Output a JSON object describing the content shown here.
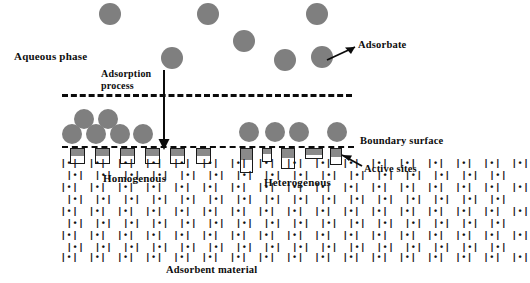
{
  "figure": {
    "background_color": "#ffffff",
    "particle_color": "#7f7f7f",
    "line_color": "#0b0b0b",
    "pore_fill_color": "#8a8a8a"
  },
  "labels": {
    "aqueous_phase": "Aqueous phase",
    "adsorption_process_line1": "Adsorption",
    "adsorption_process_line2": "process",
    "adsorbate": "Adsorbate",
    "boundary_surface": "Boundary surface",
    "active_sites": "Active sites",
    "homogenous": "Homogenous",
    "heterogenous": "Heterogenous",
    "adsorbent_material": "Adsorbent material"
  },
  "icons": {
    "active_site_glyph": "|•|",
    "adsorbate_marker": "circle-particle"
  },
  "free_particles": [
    {
      "x": 110,
      "y": 14,
      "r": 11
    },
    {
      "x": 208,
      "y": 14,
      "r": 11
    },
    {
      "x": 317,
      "y": 14,
      "r": 11
    },
    {
      "x": 244,
      "y": 41,
      "r": 11
    },
    {
      "x": 172,
      "y": 58,
      "r": 11
    },
    {
      "x": 285,
      "y": 60,
      "r": 11
    },
    {
      "x": 322,
      "y": 57,
      "r": 11
    }
  ],
  "adsorbed_particles": [
    {
      "x": 84,
      "y": 119,
      "r": 10
    },
    {
      "x": 108,
      "y": 119,
      "r": 10
    },
    {
      "x": 72,
      "y": 133,
      "r": 10
    },
    {
      "x": 96,
      "y": 133,
      "r": 10
    },
    {
      "x": 120,
      "y": 133,
      "r": 10
    },
    {
      "x": 142,
      "y": 133,
      "r": 10
    },
    {
      "x": 249,
      "y": 131,
      "r": 10
    },
    {
      "x": 275,
      "y": 131,
      "r": 10
    },
    {
      "x": 299,
      "y": 131,
      "r": 10
    },
    {
      "x": 337,
      "y": 131,
      "r": 10
    }
  ],
  "lines": {
    "aqueous_boundary_dashed": {
      "x": 62,
      "y": 94,
      "width": 290
    },
    "boundary_surface_dashed": {
      "x": 62,
      "y": 146,
      "width": 292
    },
    "adsorption_arrow": {
      "x": 163,
      "y_top": 70,
      "y_bottom": 147
    }
  },
  "lattice": {
    "rows": 9,
    "glyph": "|•|",
    "description": "staggered rows of active-site glyphs filling the adsorbent bulk"
  },
  "pores_homogenous": [
    {
      "x": 70,
      "y": 149,
      "w": 15,
      "h": 16
    },
    {
      "x": 95,
      "y": 149,
      "w": 15,
      "h": 16
    },
    {
      "x": 120,
      "y": 149,
      "w": 15,
      "h": 16
    },
    {
      "x": 145,
      "y": 149,
      "w": 15,
      "h": 16
    },
    {
      "x": 170,
      "y": 149,
      "w": 15,
      "h": 16
    }
  ],
  "pores_heterogenous": [
    {
      "x": 240,
      "y": 149,
      "w": 13,
      "h": 24
    },
    {
      "x": 262,
      "y": 149,
      "w": 10,
      "h": 14
    },
    {
      "x": 281,
      "y": 149,
      "w": 14,
      "h": 20
    },
    {
      "x": 305,
      "y": 149,
      "w": 18,
      "h": 11
    },
    {
      "x": 330,
      "y": 149,
      "w": 12,
      "h": 17
    }
  ]
}
